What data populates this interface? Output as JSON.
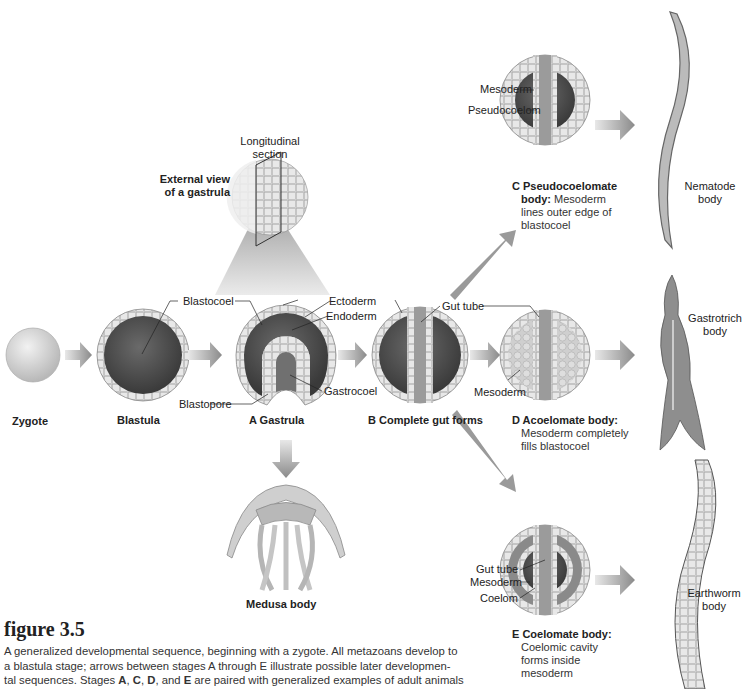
{
  "figure": {
    "number_label": "figure 3.5",
    "caption_lines": [
      "A generalized developmental sequence, beginning with a zygote. All metazoans develop to",
      "a blastula stage; arrows between stages A through E illustrate possible later developmen-",
      "tal sequences. Stages A, C, D, and E are paired with generalized examples of adult animals"
    ],
    "caption_emphasis": [
      "A",
      "C",
      "D",
      "E"
    ]
  },
  "stages": {
    "zygote": {
      "label": "Zygote"
    },
    "blastula": {
      "label": "Blastula"
    },
    "gastrula": {
      "label": "A Gastrula"
    },
    "complete_gut": {
      "label": "B Complete gut forms"
    },
    "pseudocoelomate": {
      "title": "C Pseudocoelomate",
      "title_cont": "body:",
      "desc_1": " Mesoderm",
      "desc_2": "lines outer edge of",
      "desc_3": "blastocoel"
    },
    "acoelomate": {
      "title": "D Acoelomate body:",
      "desc_1": "Mesoderm completely",
      "desc_2": "fills blastocoel"
    },
    "coelomate": {
      "title": "E Coelomate body:",
      "desc_1": "Coelomic cavity",
      "desc_2": "forms inside",
      "desc_3": "mesoderm"
    }
  },
  "labels": {
    "longitudinal_section_1": "Longitudinal",
    "longitudinal_section_2": "section",
    "external_view_1": "External view",
    "external_view_2": "of a gastrula",
    "blastocoel": "Blastocoel",
    "blastopore": "Blastopore",
    "ectoderm": "Ectoderm",
    "endoderm": "Endoderm",
    "gastrocoel": "Gastrocoel",
    "gut_tube_b": "Gut tube",
    "mesoderm_c": "Mesoderm",
    "pseudocoelom": "Pseudocoelom",
    "mesoderm_d": "Mesoderm",
    "gut_tube_e": "Gut tube",
    "mesoderm_e": "Mesoderm",
    "coelom": "Coelom"
  },
  "organisms": {
    "medusa": "Medusa body",
    "nematode_1": "Nematode",
    "nematode_2": "body",
    "gastrotrich_1": "Gastrotrich",
    "gastrotrich_2": "body",
    "earthworm_1": "Earthworm",
    "earthworm_2": "body"
  },
  "colors": {
    "background": "#ffffff",
    "cavity_dark": "#4a4a4a",
    "cell_layer": "#d8d8d8",
    "arrow": "#8c8c8c"
  }
}
